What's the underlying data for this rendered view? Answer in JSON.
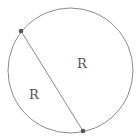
{
  "diagram": {
    "circle": {
      "cx": 70.5,
      "cy": 70.5,
      "r": 62.5,
      "stroke": "#8a8a8a"
    },
    "chord": {
      "x1": 21,
      "y1": 31,
      "x2": 83,
      "y2": 131,
      "stroke": "#8a8a8a"
    },
    "points": [
      {
        "x": 21,
        "y": 31,
        "color": "#555555"
      },
      {
        "x": 83,
        "y": 131,
        "color": "#555555"
      }
    ],
    "labels": {
      "minor_segment": "R",
      "major_segment": "R"
    }
  }
}
